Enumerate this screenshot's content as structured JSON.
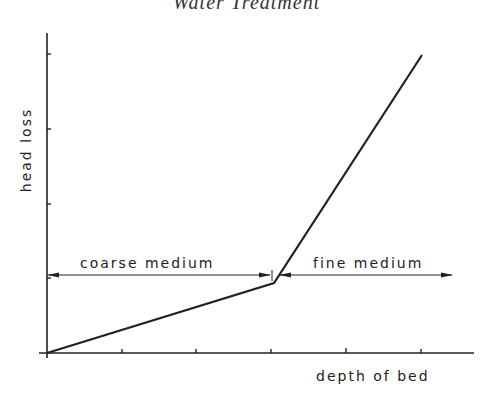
{
  "page_header": "Water Treatment",
  "diagram": {
    "y_axis_label": "head loss",
    "x_axis_label": "depth of bed",
    "regions": [
      {
        "label": "coarse medium"
      },
      {
        "label": "fine medium"
      }
    ],
    "colors": {
      "ink": "#222222",
      "background": "#ffffff"
    }
  }
}
